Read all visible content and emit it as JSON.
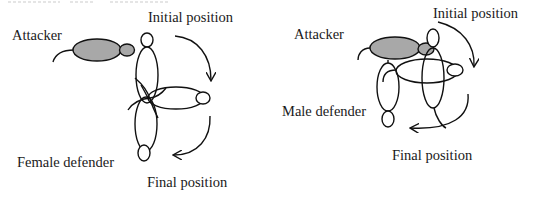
{
  "header_fragment": "",
  "panels": [
    {
      "id": "left",
      "labels": {
        "attacker": "Attacker",
        "defender": "Female defender",
        "initial": "Initial position",
        "final": "Final position"
      }
    },
    {
      "id": "right",
      "labels": {
        "attacker": "Attacker",
        "defender": "Male defender",
        "initial": "Initial position",
        "final": "Final position"
      }
    }
  ],
  "colors": {
    "attacker_fill": "#a8a8a8",
    "outline": "#111111",
    "background": "#ffffff"
  }
}
